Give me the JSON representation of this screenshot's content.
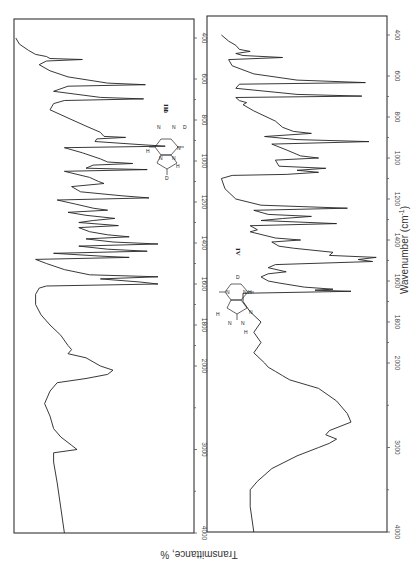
{
  "chart_data": [
    {
      "type": "line",
      "id": "III",
      "label": "III",
      "compound": "8-deuterated purine analogue (N-D, C-D)",
      "xlabel": "Wavenumber (cm-1)",
      "ylabel": "Transmittance, %",
      "xlim": [
        400,
        4000
      ],
      "ylim": [
        0,
        100
      ],
      "x_ticks": [
        400,
        600,
        800,
        1000,
        1200,
        1400,
        1600,
        1800,
        2000,
        3000,
        4000
      ],
      "x_tick_labels": [
        "400",
        "600",
        "800",
        "1000",
        "1200",
        "1400",
        "1600",
        "1800",
        "2000",
        "3000",
        "4000"
      ],
      "series": [
        {
          "name": "III",
          "points": [
            [
              400,
              99
            ],
            [
              430,
              97
            ],
            [
              460,
              92
            ],
            [
              480,
              88
            ],
            [
              490,
              82
            ],
            [
              500,
              80
            ],
            [
              505,
              62
            ],
            [
              512,
              82
            ],
            [
              530,
              86
            ],
            [
              560,
              80
            ],
            [
              590,
              70
            ],
            [
              620,
              48
            ],
            [
              628,
              27
            ],
            [
              635,
              70
            ],
            [
              660,
              78
            ],
            [
              690,
              52
            ],
            [
              697,
              28
            ],
            [
              705,
              72
            ],
            [
              720,
              78
            ],
            [
              750,
              80
            ],
            [
              790,
              70
            ],
            [
              830,
              60
            ],
            [
              860,
              52
            ],
            [
              880,
              50
            ],
            [
              885,
              38
            ],
            [
              892,
              54
            ],
            [
              905,
              55
            ],
            [
              920,
              30
            ],
            [
              928,
              16
            ],
            [
              935,
              72
            ],
            [
              960,
              62
            ],
            [
              990,
              52
            ],
            [
              1005,
              48
            ],
            [
              1012,
              34
            ],
            [
              1020,
              56
            ],
            [
              1035,
              60
            ],
            [
              1042,
              26
            ],
            [
              1050,
              72
            ],
            [
              1080,
              58
            ],
            [
              1100,
              53
            ],
            [
              1110,
              50
            ],
            [
              1125,
              68
            ],
            [
              1150,
              63
            ],
            [
              1170,
              40
            ],
            [
              1180,
              25
            ],
            [
              1190,
              76
            ],
            [
              1210,
              66
            ],
            [
              1230,
              56
            ],
            [
              1240,
              48
            ],
            [
              1250,
              70
            ],
            [
              1265,
              60
            ],
            [
              1280,
              44
            ],
            [
              1290,
              56
            ],
            [
              1300,
              64
            ],
            [
              1315,
              42
            ],
            [
              1325,
              64
            ],
            [
              1345,
              58
            ],
            [
              1360,
              48
            ],
            [
              1370,
              36
            ],
            [
              1380,
              60
            ],
            [
              1395,
              45
            ],
            [
              1405,
              20
            ],
            [
              1415,
              64
            ],
            [
              1430,
              48
            ],
            [
              1440,
              26
            ],
            [
              1450,
              78
            ],
            [
              1465,
              50
            ],
            [
              1470,
              36
            ],
            [
              1480,
              88
            ],
            [
              1500,
              82
            ],
            [
              1530,
              72
            ],
            [
              1555,
              58
            ],
            [
              1565,
              20
            ],
            [
              1575,
              52
            ],
            [
              1590,
              30
            ],
            [
              1600,
              20
            ],
            [
              1610,
              82
            ],
            [
              1620,
              86
            ],
            [
              1650,
              88
            ],
            [
              1700,
              88
            ],
            [
              1750,
              85
            ],
            [
              1800,
              80
            ],
            [
              1850,
              74
            ],
            [
              1900,
              70
            ],
            [
              1920,
              68
            ],
            [
              1940,
              70
            ],
            [
              1960,
              60
            ],
            [
              2000,
              52
            ],
            [
              2050,
              45
            ],
            [
              2100,
              48
            ],
            [
              2150,
              60
            ],
            [
              2200,
              76
            ],
            [
              2300,
              80
            ],
            [
              2450,
              83
            ],
            [
              2600,
              80
            ],
            [
              2750,
              78
            ],
            [
              2850,
              74
            ],
            [
              2950,
              68
            ],
            [
              3000,
              65
            ],
            [
              3040,
              78
            ],
            [
              3150,
              78
            ],
            [
              3400,
              76
            ],
            [
              3700,
              74
            ],
            [
              4000,
              72
            ]
          ]
        }
      ]
    },
    {
      "type": "line",
      "id": "IV",
      "label": "IV",
      "compound": "purine analogue (N-H, C-D)",
      "xlabel": "Wavenumber (cm-1)",
      "ylabel": "Transmittance, %",
      "xlim": [
        400,
        4000
      ],
      "ylim": [
        0,
        100
      ],
      "x_ticks": [
        400,
        600,
        800,
        1000,
        1200,
        1400,
        1600,
        1800,
        2000,
        3000,
        4000
      ],
      "x_tick_labels": [
        "400",
        "600",
        "800",
        "1000",
        "1200",
        "1400",
        "1600",
        "1800",
        "2000",
        "3000",
        "4000"
      ],
      "series": [
        {
          "name": "IV",
          "points": [
            [
              400,
              92
            ],
            [
              430,
              88
            ],
            [
              450,
              84
            ],
            [
              470,
              82
            ],
            [
              480,
              76
            ],
            [
              490,
              84
            ],
            [
              500,
              80
            ],
            [
              510,
              58
            ],
            [
              520,
              88
            ],
            [
              550,
              86
            ],
            [
              590,
              74
            ],
            [
              620,
              50
            ],
            [
              632,
              12
            ],
            [
              640,
              82
            ],
            [
              660,
              84
            ],
            [
              690,
              50
            ],
            [
              698,
              14
            ],
            [
              705,
              84
            ],
            [
              720,
              82
            ],
            [
              730,
              78
            ],
            [
              740,
              80
            ],
            [
              770,
              74
            ],
            [
              820,
              62
            ],
            [
              850,
              58
            ],
            [
              870,
              52
            ],
            [
              880,
              42
            ],
            [
              895,
              68
            ],
            [
              910,
              50
            ],
            [
              920,
              10
            ],
            [
              932,
              64
            ],
            [
              960,
              56
            ],
            [
              990,
              48
            ],
            [
              1000,
              38
            ],
            [
              1010,
              62
            ],
            [
              1040,
              60
            ],
            [
              1050,
              34
            ],
            [
              1060,
              50
            ],
            [
              1070,
              38
            ],
            [
              1080,
              56
            ],
            [
              1085,
              86
            ],
            [
              1100,
              92
            ],
            [
              1150,
              90
            ],
            [
              1200,
              84
            ],
            [
              1230,
              70
            ],
            [
              1245,
              22
            ],
            [
              1255,
              74
            ],
            [
              1275,
              66
            ],
            [
              1285,
              42
            ],
            [
              1295,
              58
            ],
            [
              1305,
              70
            ],
            [
              1320,
              28
            ],
            [
              1330,
              76
            ],
            [
              1350,
              72
            ],
            [
              1360,
              76
            ],
            [
              1390,
              62
            ],
            [
              1400,
              48
            ],
            [
              1410,
              64
            ],
            [
              1430,
              60
            ],
            [
              1440,
              52
            ],
            [
              1460,
              30
            ],
            [
              1475,
              32
            ],
            [
              1485,
              6
            ],
            [
              1495,
              16
            ],
            [
              1505,
              8
            ],
            [
              1520,
              62
            ],
            [
              1535,
              66
            ],
            [
              1555,
              56
            ],
            [
              1565,
              66
            ],
            [
              1580,
              70
            ],
            [
              1600,
              66
            ],
            [
              1610,
              60
            ],
            [
              1630,
              46
            ],
            [
              1640,
              30
            ],
            [
              1645,
              40
            ],
            [
              1650,
              20
            ],
            [
              1660,
              80
            ],
            [
              1700,
              80
            ],
            [
              1750,
              76
            ],
            [
              1800,
              70
            ],
            [
              1850,
              74
            ],
            [
              1900,
              70
            ],
            [
              1950,
              74
            ],
            [
              2000,
              68
            ],
            [
              2050,
              66
            ],
            [
              2100,
              62
            ],
            [
              2150,
              58
            ],
            [
              2200,
              54
            ],
            [
              2300,
              38
            ],
            [
              2450,
              28
            ],
            [
              2600,
              22
            ],
            [
              2700,
              20
            ],
            [
              2800,
              32
            ],
            [
              2850,
              34
            ],
            [
              2900,
              28
            ],
            [
              2950,
              32
            ],
            [
              3000,
              38
            ],
            [
              3100,
              50
            ],
            [
              3250,
              64
            ],
            [
              3400,
              72
            ],
            [
              3500,
              76
            ],
            [
              3700,
              76
            ],
            [
              4000,
              74
            ]
          ]
        }
      ]
    }
  ],
  "labels": {
    "panel_iii": "III",
    "panel_iv": "IV",
    "xlabel": "Wavenumber (cm",
    "xlabel_sup": "-1",
    "xlabel_close": ")",
    "ylabel": "Transmittance, %"
  },
  "structures": {
    "iii_atoms": [
      "D",
      "N",
      "N",
      "D",
      "H",
      "N",
      "N",
      "N",
      "H"
    ],
    "iv_atoms": [
      "D",
      "N",
      "N",
      "H",
      "H",
      "N",
      "N",
      "N",
      "H"
    ]
  }
}
